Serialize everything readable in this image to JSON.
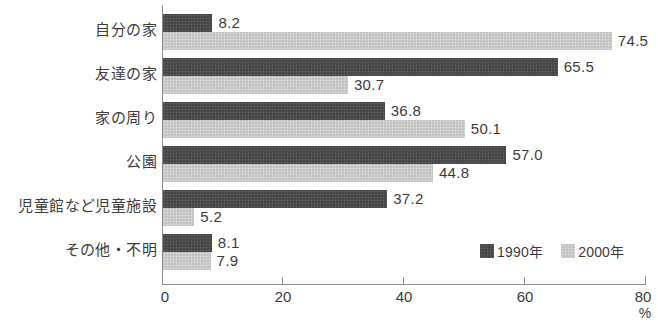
{
  "chart_data": {
    "type": "bar",
    "orientation": "horizontal",
    "title": "",
    "xlabel": "%",
    "ylabel": "",
    "xlim": [
      0,
      80
    ],
    "xticks": [
      0,
      20,
      40,
      60,
      80
    ],
    "xtick_labels": [
      "0",
      "20",
      "40",
      "60",
      "80"
    ],
    "unit": "%",
    "grid": false,
    "legend_position": "bottom-right",
    "categories": [
      "自分の家",
      "友達の家",
      "家の周り",
      "公園",
      "児童館など児童施設",
      "その他・不明"
    ],
    "series": [
      {
        "name": "1990年",
        "color": "#4b4b4b",
        "values": [
          8.2,
          65.5,
          36.8,
          57.0,
          37.2,
          8.1
        ],
        "value_labels": [
          "8.2",
          "65.5",
          "36.8",
          "57.0",
          "37.2",
          "8.1"
        ]
      },
      {
        "name": "2000年",
        "color": "#c9c9c9",
        "values": [
          74.5,
          30.7,
          50.1,
          44.8,
          5.2,
          7.9
        ],
        "value_labels": [
          "74.5",
          "30.7",
          "50.1",
          "44.8",
          "5.2",
          "7.9"
        ]
      }
    ]
  }
}
